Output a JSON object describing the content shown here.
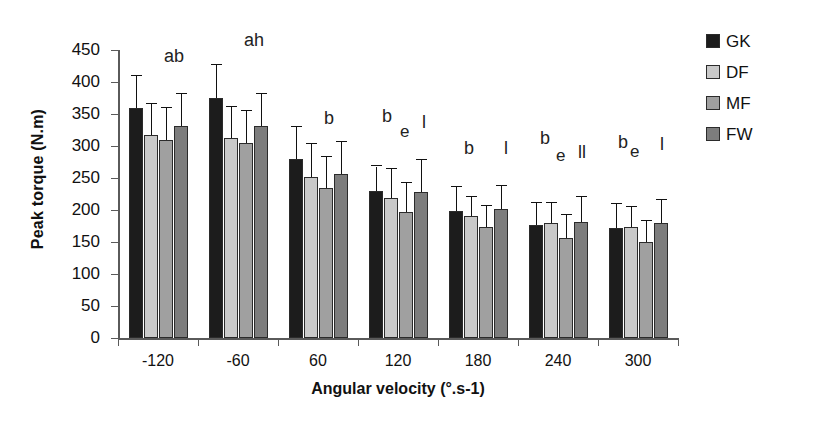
{
  "chart_data": {
    "type": "bar",
    "title": "",
    "xlabel": "Angular velocity (°.s-1)",
    "ylabel": "Peak torque (N.m)",
    "categories": [
      "-120",
      "-60",
      "60",
      "120",
      "180",
      "240",
      "300"
    ],
    "ylim": [
      0,
      450
    ],
    "yticks": [
      0,
      50,
      100,
      150,
      200,
      250,
      300,
      350,
      400,
      450
    ],
    "grid": false,
    "legend_position": "right",
    "series": [
      {
        "name": "GK",
        "color": "#1c1c1c",
        "values": [
          360,
          375,
          279,
          230,
          198,
          176,
          172
        ],
        "errors": [
          50,
          52,
          51,
          38,
          38,
          35,
          37
        ]
      },
      {
        "name": "DF",
        "color": "#c9c9c9",
        "values": [
          317,
          312,
          252,
          219,
          190,
          179,
          174
        ],
        "errors": [
          48,
          49,
          51,
          45,
          31,
          32,
          30
        ]
      },
      {
        "name": "MF",
        "color": "#a0a0a0",
        "values": [
          310,
          305,
          235,
          197,
          174,
          156,
          150
        ],
        "errors": [
          50,
          50,
          48,
          45,
          33,
          36,
          33
        ]
      },
      {
        "name": "FW",
        "color": "#7d7d7d",
        "values": [
          332,
          332,
          257,
          228,
          202,
          182,
          179
        ],
        "errors": [
          50,
          50,
          49,
          50,
          36,
          38,
          37
        ]
      }
    ],
    "annotations": [
      {
        "category": "-120",
        "items": [
          {
            "text": "ab",
            "dx": 46,
            "dy": -4,
            "size": 18
          }
        ]
      },
      {
        "category": "-60",
        "items": [
          {
            "text": "ah",
            "dx": 46,
            "dy": -20,
            "size": 18
          }
        ]
      },
      {
        "category": "60",
        "items": [
          {
            "text": "b",
            "dx": 46,
            "dy": 58,
            "size": 18
          }
        ]
      },
      {
        "category": "120",
        "items": [
          {
            "text": "b",
            "dx": 24,
            "dy": 56,
            "size": 18
          },
          {
            "text": "e",
            "dx": 42,
            "dy": 72,
            "size": 17
          },
          {
            "text": "l",
            "dx": 64,
            "dy": 62,
            "size": 18
          }
        ]
      },
      {
        "category": "180",
        "items": [
          {
            "text": "b",
            "dx": 26,
            "dy": 88,
            "size": 18
          },
          {
            "text": "l",
            "dx": 66,
            "dy": 88,
            "size": 18
          }
        ]
      },
      {
        "category": "240",
        "items": [
          {
            "text": "b",
            "dx": 22,
            "dy": 78,
            "size": 18
          },
          {
            "text": "e",
            "dx": 38,
            "dy": 96,
            "size": 17
          },
          {
            "text": "ll",
            "dx": 60,
            "dy": 92,
            "size": 18
          }
        ]
      },
      {
        "category": "300",
        "items": [
          {
            "text": "b",
            "dx": 20,
            "dy": 82,
            "size": 18
          },
          {
            "text": "e",
            "dx": 32,
            "dy": 92,
            "size": 17
          },
          {
            "text": "l",
            "dx": 62,
            "dy": 84,
            "size": 18
          }
        ]
      }
    ]
  },
  "legend": {
    "entries": [
      {
        "label": "GK",
        "color": "#1c1c1c"
      },
      {
        "label": "DF",
        "color": "#c9c9c9"
      },
      {
        "label": "MF",
        "color": "#a0a0a0"
      },
      {
        "label": "FW",
        "color": "#7d7d7d"
      }
    ]
  }
}
